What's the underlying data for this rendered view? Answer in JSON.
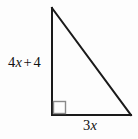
{
  "figure": {
    "kind": "right-triangle-diagram",
    "width": 138,
    "height": 139,
    "background_color": "#fdfdfd",
    "stroke_color": "#1a1a1a",
    "stroke_width": 2,
    "right_angle_marker": {
      "present": true,
      "color": "#8a8a8a",
      "size": 12,
      "at_vertex": "bottom-left"
    },
    "vertices": {
      "apex": {
        "x": 52,
        "y": 8
      },
      "right_angle": {
        "x": 52,
        "y": 115
      },
      "base_right": {
        "x": 131,
        "y": 115
      }
    }
  },
  "labels": {
    "vertical_leg": {
      "full_text": "4x + 4",
      "coefficient": "4",
      "variable": "x",
      "operator": "+",
      "constant": "4",
      "side": "left",
      "describes": "vertical-leg"
    },
    "horizontal_leg": {
      "full_text": "3x",
      "coefficient": "3",
      "variable": "x",
      "side": "bottom",
      "describes": "horizontal-leg"
    }
  }
}
